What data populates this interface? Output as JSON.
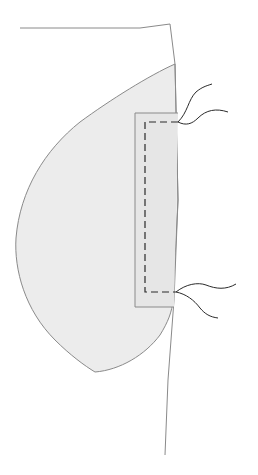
{
  "diagram": {
    "title": "",
    "type": "sewing-illustration",
    "colors": {
      "background": "#ffffff",
      "outline": "#8a8a8a",
      "fabric_fill": "#ececec",
      "stitch": "#2a2a2a",
      "thread": "#2a2a2a"
    },
    "elements": [
      {
        "name": "garment-panel",
        "label": ""
      },
      {
        "name": "pocket-bag",
        "label": ""
      },
      {
        "name": "pocket-facing",
        "label": ""
      },
      {
        "name": "stitch-line",
        "label": ""
      },
      {
        "name": "thread-tail-top",
        "label": ""
      },
      {
        "name": "thread-tail-bottom",
        "label": ""
      }
    ]
  }
}
